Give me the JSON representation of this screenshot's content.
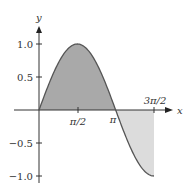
{
  "chart_data": {
    "type": "area",
    "title": "",
    "function": "y = sin(x)",
    "xlabel": "x",
    "ylabel": "y",
    "x_ticks": [
      {
        "value": 1.5708,
        "label": "π/2"
      },
      {
        "value": 3.1416,
        "label": "π"
      },
      {
        "value": 4.7124,
        "label": "3π/2"
      }
    ],
    "y_ticks": [
      {
        "value": 1.0,
        "label": "1.0"
      },
      {
        "value": 0.5,
        "label": "0.5"
      },
      {
        "value": -0.5,
        "label": "−0.5"
      },
      {
        "value": -1.0,
        "label": "−1.0"
      }
    ],
    "xlim": [
      0,
      5.1
    ],
    "ylim": [
      -1.05,
      1.25
    ],
    "grid": false,
    "series": [
      {
        "name": "sin(x)",
        "x": [
          0,
          0.3927,
          0.7854,
          1.1781,
          1.5708,
          1.9635,
          2.3562,
          2.7489,
          3.1416,
          3.5343,
          3.927,
          4.3197,
          4.7124
        ],
        "y": [
          0,
          0.383,
          0.707,
          0.924,
          1.0,
          0.924,
          0.707,
          0.383,
          0,
          -0.383,
          -0.707,
          -0.924,
          -1.0
        ]
      }
    ],
    "shaded_regions": [
      {
        "from": 0,
        "to": 3.1416,
        "sign": "positive",
        "color": "#a9a9a9"
      },
      {
        "from": 3.1416,
        "to": 4.7124,
        "sign": "negative",
        "color": "#dcdcdc"
      }
    ]
  },
  "labels": {
    "x_axis": "x",
    "y_axis": "y",
    "xt0": "π/2",
    "xt1": "π",
    "xt2": "3π/2",
    "yt0": "1.0",
    "yt1": "0.5",
    "yt2": "−0.5",
    "yt3": "−1.0"
  },
  "colors": {
    "positive_fill": "#a9a9a9",
    "negative_fill": "#dcdcdc",
    "curve": "#555555",
    "axis": "#333333"
  }
}
